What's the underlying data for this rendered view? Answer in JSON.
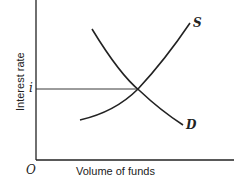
{
  "diagram": {
    "y_axis_label": "Interest rate",
    "x_axis_label": "Volume of funds",
    "origin_label": "O",
    "equilibrium_rate_label": "i",
    "curves": [
      {
        "name": "supply",
        "label": "S"
      },
      {
        "name": "demand",
        "label": "D"
      }
    ]
  }
}
